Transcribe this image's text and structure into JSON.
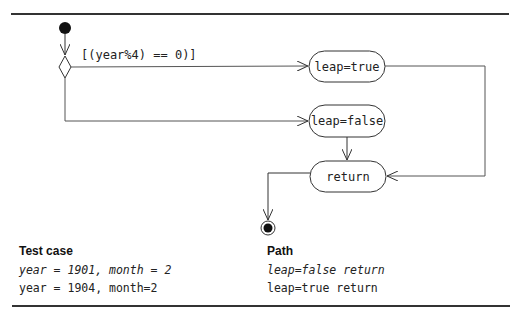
{
  "diagram": {
    "guard_label": "[(year%4) == 0)]",
    "nodes": {
      "leap_true": "leap=true",
      "leap_false": "leap=false",
      "return": "return"
    },
    "start_node": "initial-node",
    "end_node": "final-node"
  },
  "table": {
    "headers": {
      "test_case": "Test case",
      "path": "Path"
    },
    "rows": [
      {
        "test_case": "year = 1901, month = 2",
        "path": "leap=false return",
        "italic": true
      },
      {
        "test_case": "year = 1904, month=2",
        "path": "leap=true return",
        "italic": false
      }
    ]
  }
}
